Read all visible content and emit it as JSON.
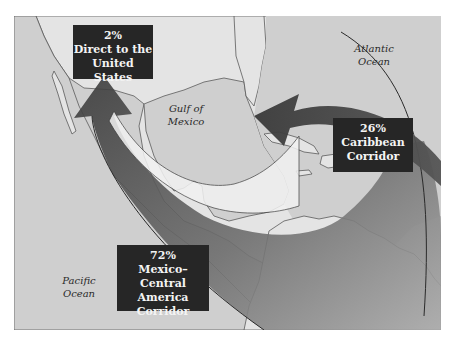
{
  "map": {
    "title": "Drug trafficking corridors to the United States",
    "colors": {
      "sea": "#cfcfcf",
      "land": "#e4e4e4",
      "border": "#5a5a5a",
      "arrow_dark": "#3a3a3a",
      "arrow_mid": "#7a7a7a",
      "arrow_light": "#f2f2f2",
      "label_bg": "#262626",
      "label_text": "#f4f4f4"
    },
    "oceans": [
      {
        "line1": "Atlantic",
        "line2": "Ocean"
      },
      {
        "line1": "Gulf of",
        "line2": "Mexico"
      },
      {
        "line1": "Pacific",
        "line2": "Ocean"
      }
    ],
    "corridors": [
      {
        "percent": "2%",
        "line1": "Direct to the",
        "line2": "United States",
        "line3": ""
      },
      {
        "percent": "26%",
        "line1": "Caribbean",
        "line2": "Corridor",
        "line3": ""
      },
      {
        "percent": "72%",
        "line1": "Mexico–",
        "line2": "Central America",
        "line3": "Corridor"
      }
    ]
  }
}
